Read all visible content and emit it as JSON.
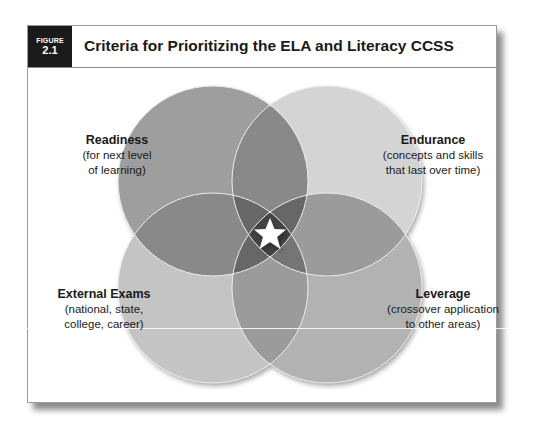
{
  "figure": {
    "badge_label": "FIGURE",
    "badge_number": "2.1",
    "title": "Criteria for Prioritizing the ELA and Literacy CCSS"
  },
  "venn": {
    "center_icon": "star-icon",
    "circles": [
      {
        "id": "readiness",
        "name": "Readiness",
        "desc_line1": "(for next level",
        "desc_line2": "of learning)",
        "color": "#9c9c9c"
      },
      {
        "id": "endurance",
        "name": "Endurance",
        "desc_line1": "(concepts and skills",
        "desc_line2": "that last over time)",
        "color": "#d4d4d4"
      },
      {
        "id": "external-exams",
        "name": "External Exams",
        "desc_line1": "(national, state,",
        "desc_line2": "college, career)",
        "color": "#c4c4c4"
      },
      {
        "id": "leverage",
        "name": "Leverage",
        "desc_line1": "(crossover application",
        "desc_line2": "to other areas)",
        "color": "#afafaf"
      }
    ]
  }
}
